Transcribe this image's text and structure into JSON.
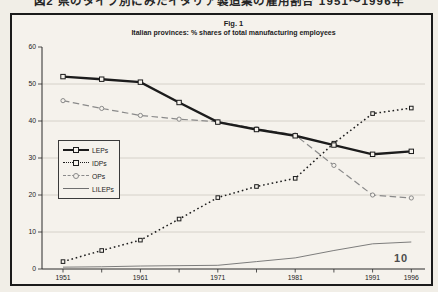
{
  "page": {
    "top_caption_clipped": "図2 県のタイプ別にみたイタリア製造業の雇用割合 1951〜1996年",
    "page_number": "10"
  },
  "colors": {
    "paper": "#f5f2ec",
    "ink": "#1c1c1c",
    "grey_line": "#8a8a8a",
    "thin_line": "#6f6f6f",
    "gridline": "#cdc9c1",
    "axis": "#2a2a2a"
  },
  "chart_data": {
    "type": "line",
    "title": "Fig. 1",
    "subtitle": "Italian provinces: % shares of total manufacturing employees",
    "x": [
      1951,
      1956,
      1961,
      1966,
      1971,
      1976,
      1981,
      1986,
      1991,
      1996
    ],
    "x_tick_positions": [
      1951,
      1961,
      1971,
      1981,
      1991,
      1996
    ],
    "x_tick_labels": [
      "1951",
      "1961",
      "1971",
      "1981",
      "1991",
      "1996"
    ],
    "ylim": [
      0,
      60
    ],
    "y_ticks": [
      0,
      10,
      20,
      30,
      40,
      50,
      60
    ],
    "grid": "horizontal",
    "legend_position": "middle-left",
    "series": [
      {
        "name": "LEPs",
        "values": [
          52,
          51.3,
          50.5,
          45,
          39.7,
          37.7,
          36,
          33.5,
          31,
          31.8
        ],
        "line": "solid-thick",
        "marker": "open-square",
        "color": "#1c1c1c"
      },
      {
        "name": "IDPs",
        "values": [
          2,
          5,
          7.8,
          13.5,
          19.3,
          22.3,
          24.5,
          34,
          42,
          43.5
        ],
        "line": "dotted",
        "marker": "open-square-small",
        "color": "#1c1c1c"
      },
      {
        "name": "OPs",
        "values": [
          45.5,
          43.4,
          41.5,
          40.5,
          39.8,
          37.9,
          36.2,
          28,
          20,
          19.2
        ],
        "line": "dashed",
        "marker": "open-circle",
        "color": "#8a8a8a"
      },
      {
        "name": "LILEPs",
        "values": [
          0.5,
          0.6,
          0.8,
          0.9,
          1,
          2,
          3,
          5,
          6.8,
          7.3
        ],
        "line": "solid-thin",
        "marker": "none",
        "color": "#6f6f6f"
      }
    ]
  }
}
